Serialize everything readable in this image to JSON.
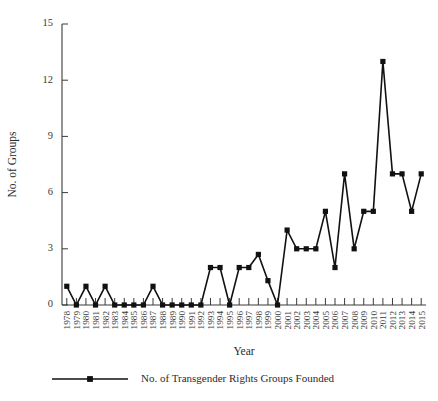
{
  "chart_data": {
    "type": "line",
    "title": "",
    "subtitle": "",
    "xlabel": "Year",
    "ylabel": "No. of Groups",
    "grid": false,
    "legend_position": "bottom",
    "ylim": [
      0,
      15
    ],
    "yticks": [
      0,
      3,
      6,
      9,
      12,
      15
    ],
    "ytick_labels": [
      "0",
      "3",
      "6",
      "9",
      "12",
      "15"
    ],
    "categories": [
      "1978",
      "1979",
      "1980",
      "1981",
      "1982",
      "1983",
      "1984",
      "1985",
      "1986",
      "1987",
      "1988",
      "1989",
      "1990",
      "1991",
      "1992",
      "1993",
      "1994",
      "1995",
      "1996",
      "1997",
      "1998",
      "1999",
      "2000",
      "2001",
      "2002",
      "2003",
      "2004",
      "2005",
      "2006",
      "2007",
      "2008",
      "2009",
      "2010",
      "2011",
      "2012",
      "2013",
      "2014",
      "2015"
    ],
    "series": [
      {
        "name": "No. of Transgender Rights Groups Founded",
        "marker": "square",
        "color": "#111111",
        "values": [
          1,
          0,
          1,
          0,
          1,
          0,
          0,
          0,
          0,
          1,
          0,
          0,
          0,
          0,
          0,
          2,
          2,
          0,
          2,
          2,
          2.7,
          1.3,
          0,
          4,
          3,
          3,
          3,
          5,
          2,
          7,
          3,
          5,
          5,
          13,
          7,
          7,
          5,
          7
        ]
      }
    ]
  },
  "legend": {
    "entries": [
      {
        "label": "No. of Transgender Rights Groups Founded"
      }
    ]
  },
  "axes": {
    "x_title": "Year",
    "y_title": "No. of Groups"
  }
}
